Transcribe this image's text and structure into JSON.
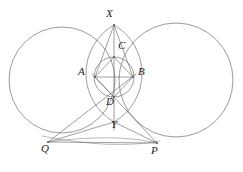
{
  "figure": {
    "type": "geometry-diagram",
    "background_color": "#ffffff",
    "stroke_color": "#6e6e6e",
    "label_color": "#1c1c1c",
    "caption": "",
    "points": [
      {
        "id": "X",
        "label": "X",
        "x": 114,
        "y": 25,
        "label_x": 106,
        "label_y": 8,
        "role": "upper-intersection-of-large-circles"
      },
      {
        "id": "C",
        "label": "C",
        "x": 114,
        "y": 57,
        "label_x": 118,
        "label_y": 40,
        "role": "top-vertex-of-inscribed-quadrilateral"
      },
      {
        "id": "A",
        "label": "A",
        "x": 95,
        "y": 77,
        "label_x": 78,
        "label_y": 66,
        "role": "left-vertex-of-inscribed-quadrilateral"
      },
      {
        "id": "B",
        "label": "B",
        "x": 133,
        "y": 77,
        "label_x": 138,
        "label_y": 66,
        "role": "right-vertex-of-inscribed-quadrilateral"
      },
      {
        "id": "D",
        "label": "D",
        "x": 114,
        "y": 97,
        "label_x": 106,
        "label_y": 96,
        "role": "bottom-vertex-of-inscribed-quadrilateral"
      },
      {
        "id": "Y",
        "label": "Y",
        "x": 114,
        "y": 122,
        "label_x": 111,
        "label_y": 119,
        "role": "lower-intersection-of-large-circles"
      },
      {
        "id": "Q",
        "label": "Q",
        "x": 48,
        "y": 142,
        "label_x": 41,
        "label_y": 143,
        "role": "left-external-point"
      },
      {
        "id": "P",
        "label": "P",
        "x": 157,
        "y": 143,
        "label_x": 151,
        "label_y": 145,
        "role": "right-external-point"
      }
    ],
    "circles": [
      {
        "id": "left-large-circle",
        "cx": 62,
        "cy": 80,
        "r": 53,
        "name": "large-circle-left"
      },
      {
        "id": "right-large-circle",
        "cx": 176,
        "cy": 80,
        "r": 57,
        "name": "large-circle-right"
      },
      {
        "id": "small-circle",
        "cx": 114,
        "cy": 77,
        "r": 20,
        "name": "small-circle-through-acbd"
      }
    ],
    "arcs": [
      {
        "id": "lens-left-arc",
        "from": "X",
        "to": "Y",
        "bulge": "left",
        "name": "vesica-arc-left"
      },
      {
        "id": "lens-right-arc",
        "from": "X",
        "to": "Y",
        "bulge": "right",
        "name": "vesica-arc-right"
      },
      {
        "id": "qyp-arc",
        "from": "Q",
        "to": "P",
        "bulge": "down",
        "name": "arc-through-q-y-p"
      }
    ],
    "segments": [
      {
        "id": "XY",
        "from": "X",
        "to": "Y",
        "name": "segment-x-y"
      },
      {
        "id": "AB",
        "from": "A",
        "to": "B",
        "name": "segment-a-b"
      },
      {
        "id": "AC",
        "from": "A",
        "to": "C",
        "name": "segment-a-c"
      },
      {
        "id": "CB",
        "from": "C",
        "to": "B",
        "name": "segment-c-b"
      },
      {
        "id": "AD",
        "from": "A",
        "to": "D",
        "name": "segment-a-d"
      },
      {
        "id": "DB",
        "from": "D",
        "to": "B",
        "name": "segment-d-b"
      },
      {
        "id": "QD",
        "from": "Q",
        "to": "B",
        "name": "segment-q-through-d"
      },
      {
        "id": "PD",
        "from": "P",
        "to": "A",
        "name": "segment-p-through-d"
      },
      {
        "id": "QP",
        "from": "Q",
        "to": "P",
        "name": "segment-q-p"
      },
      {
        "id": "QY",
        "from": "Q",
        "to": "Y",
        "name": "segment-q-y"
      },
      {
        "id": "PY",
        "from": "P",
        "to": "Y",
        "name": "segment-p-y"
      }
    ]
  }
}
